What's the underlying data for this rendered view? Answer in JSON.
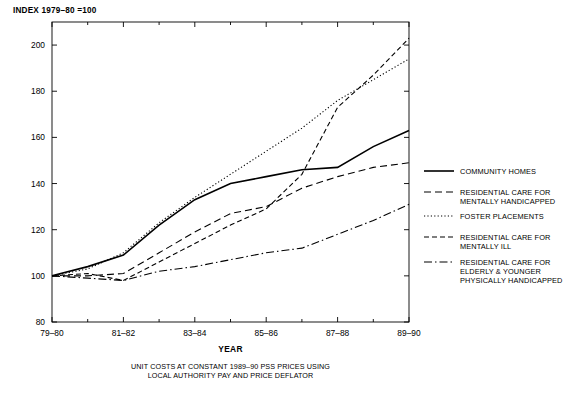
{
  "header": {
    "index_label": "INDEX 1979–80 =100"
  },
  "caption": {
    "line1": "UNIT COSTS AT CONSTANT 1989–90 PSS PRICES USING",
    "line2": "LOCAL AUTHORITY PAY AND PRICE DEFLATOR"
  },
  "legend": {
    "items": [
      {
        "label_lines": [
          "COMMUNITY HOMES"
        ],
        "dash": "none"
      },
      {
        "label_lines": [
          "RESIDENTIAL CARE FOR",
          "MENTALLY HANDICAPPED"
        ],
        "dash": "dashed-long"
      },
      {
        "label_lines": [
          "FOSTER PLACEMENTS"
        ],
        "dash": "dotted"
      },
      {
        "label_lines": [
          "RESIDENTIAL CARE FOR",
          "MENTALLY ILL"
        ],
        "dash": "dashed-short"
      },
      {
        "label_lines": [
          "RESIDENTIAL CARE FOR",
          "ELDERLY & YOUNGER",
          "PHYSICALLY HANDICAPPED"
        ],
        "dash": "dash-dot"
      }
    ]
  },
  "chart_data": {
    "type": "line",
    "title": "",
    "xlabel": "YEAR",
    "ylabel": "INDEX 1979–80 =100",
    "ylim": [
      80,
      210
    ],
    "yticks": [
      80,
      100,
      120,
      140,
      160,
      180,
      200
    ],
    "x": [
      "79–80",
      "80–81",
      "81–82",
      "82–83",
      "83–84",
      "84–85",
      "85–86",
      "86–87",
      "87–88",
      "88–89",
      "89–90"
    ],
    "xtick_labels": [
      "79–80",
      "81–82",
      "83–84",
      "85–86",
      "87–88",
      "89–90"
    ],
    "grid": false,
    "legend_position": "right",
    "series": [
      {
        "name": "COMMUNITY HOMES",
        "style": "solid",
        "values": [
          100,
          104,
          109,
          122,
          133,
          140,
          143,
          146,
          147,
          156,
          163
        ]
      },
      {
        "name": "RESIDENTIAL CARE FOR MENTALLY HANDICAPPED",
        "style": "dashed-long",
        "values": [
          100,
          100,
          101,
          110,
          119,
          127,
          130,
          138,
          143,
          147,
          149
        ]
      },
      {
        "name": "FOSTER PLACEMENTS",
        "style": "dotted",
        "values": [
          100,
          103,
          110,
          123,
          134,
          144,
          154,
          164,
          176,
          185,
          194
        ]
      },
      {
        "name": "RESIDENTIAL CARE FOR MENTALLY ILL",
        "style": "dashed-short",
        "values": [
          100,
          101,
          98,
          106,
          114,
          122,
          129,
          144,
          173,
          187,
          203
        ]
      },
      {
        "name": "RESIDENTIAL CARE FOR ELDERLY & YOUNGER PHYSICALLY HANDICAPPED",
        "style": "dash-dot",
        "values": [
          100,
          99,
          98,
          102,
          104,
          107,
          110,
          112,
          118,
          124,
          131
        ]
      }
    ]
  }
}
